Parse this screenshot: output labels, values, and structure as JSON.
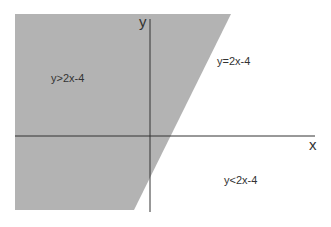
{
  "diagram": {
    "title": "",
    "shaded_region_color": "#b3b3b3",
    "axis_color": "#333333",
    "axes": {
      "x_label": "x",
      "y_label": "y"
    },
    "labels": {
      "above": "y>2x-4",
      "line": "y=2x-4",
      "below": "y<2x-4"
    }
  }
}
